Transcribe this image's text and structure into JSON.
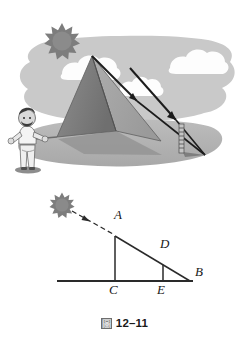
{
  "figure": {
    "caption_glyph": "圖",
    "caption_text": "12–11",
    "caption_full": "圖 12–11"
  },
  "illustration": {
    "alt_name": "pyramid-shadow-illustration",
    "sky_color": "#c9c9c9",
    "ground_color": "#b4b4b4",
    "cloud_color": "#fdfdfd",
    "sun_color": "#7d7d7d",
    "pyramid_light_face_color": "#a0a0a0",
    "pyramid_dark_face_color": "#7b7b7b",
    "pyramid_shadow_color": "#9a9a9a",
    "ray_color": "#1c1c1c",
    "elements": [
      {
        "name": "sun",
        "label": ""
      },
      {
        "name": "cloud-left",
        "label": ""
      },
      {
        "name": "cloud-middle",
        "label": ""
      },
      {
        "name": "cloud-right",
        "label": ""
      },
      {
        "name": "pyramid",
        "label": ""
      },
      {
        "name": "sun-ray-arrow-1",
        "label": ""
      },
      {
        "name": "sun-ray-arrow-2",
        "label": ""
      },
      {
        "name": "measuring-pole",
        "label": ""
      },
      {
        "name": "pole-shadow",
        "label": ""
      },
      {
        "name": "observer-person",
        "label": ""
      }
    ]
  },
  "diagram": {
    "name": "similar-triangles-diagram",
    "line_color": "#2a2a2a",
    "sun_color": "#7d7d7d",
    "points": [
      {
        "id": "A",
        "label": "A",
        "x": 115,
        "y": 51,
        "label_x": 115,
        "label_y": 31
      },
      {
        "id": "B",
        "label": "B",
        "x": 190,
        "y": 96,
        "label_x": 196,
        "label_y": 88
      },
      {
        "id": "C",
        "label": "C",
        "x": 115,
        "y": 96,
        "label_x": 111,
        "label_y": 101
      },
      {
        "id": "D",
        "label": "D",
        "x": 163,
        "y": 80,
        "label_x": 161,
        "label_y": 60
      },
      {
        "id": "E",
        "label": "E",
        "x": 163,
        "y": 96,
        "label_x": 159,
        "label_y": 101
      }
    ],
    "segments": [
      {
        "name": "ground-baseline",
        "from": "ground-left",
        "to": "B"
      },
      {
        "name": "segment-AC",
        "from": "A",
        "to": "C"
      },
      {
        "name": "segment-AB",
        "from": "A",
        "to": "B"
      },
      {
        "name": "segment-DE",
        "from": "D",
        "to": "E"
      },
      {
        "name": "sun-ray-dashed",
        "from": "sun",
        "to": "A"
      }
    ],
    "baseline_left_x": 57,
    "baseline_y": 96,
    "sun_center": {
      "x": 62,
      "y": 20
    }
  }
}
